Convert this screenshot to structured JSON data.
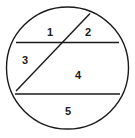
{
  "figure": {
    "type": "geometry-diagram",
    "background_color": "#ffffff",
    "stroke_color": "#1a1a1a",
    "label_color": "#1a1a1a"
  },
  "circle": {
    "name": "outer-circle",
    "center_x": 67.5,
    "center_y": 68,
    "radius": 61,
    "stroke_width": 1.4,
    "fill": "none"
  },
  "chords": [
    {
      "name": "upper-horizontal-chord",
      "x1": 16,
      "y1": 42.5,
      "x2": 119,
      "y2": 42.5,
      "stroke_width": 1.6
    },
    {
      "name": "lower-horizontal-chord",
      "x1": 15,
      "y1": 94,
      "x2": 120,
      "y2": 94,
      "stroke_width": 1.6
    },
    {
      "name": "diagonal-chord",
      "x1": 90,
      "y1": 13.5,
      "x2": 16,
      "y2": 91,
      "stroke_width": 1.4
    }
  ],
  "region_labels": [
    {
      "name": "region-label-1",
      "text": "1",
      "x": 50,
      "y": 32
    },
    {
      "name": "region-label-2",
      "text": "2",
      "x": 88,
      "y": 32
    },
    {
      "name": "region-label-3",
      "text": "3",
      "x": 25,
      "y": 60
    },
    {
      "name": "region-label-4",
      "text": "4",
      "x": 78,
      "y": 75
    },
    {
      "name": "region-label-5",
      "text": "5",
      "x": 68,
      "y": 111
    }
  ]
}
